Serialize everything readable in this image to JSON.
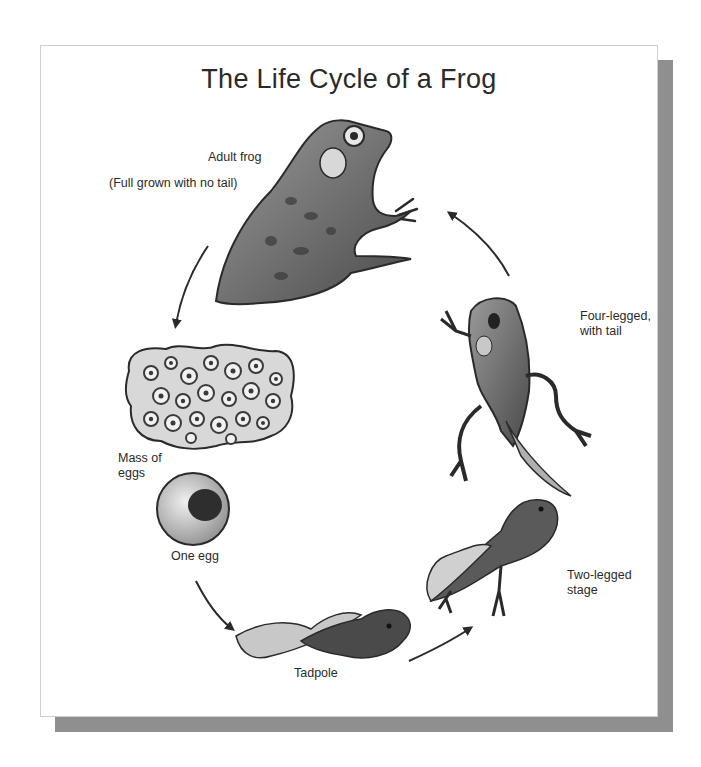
{
  "title": "The Life Cycle of a Frog",
  "stages": [
    {
      "id": "adult",
      "label": "Adult frog",
      "sublabel": "(Full grown with no tail)"
    },
    {
      "id": "egg-mass",
      "label": "Mass of\neggs"
    },
    {
      "id": "one-egg",
      "label": "One egg"
    },
    {
      "id": "tadpole",
      "label": "Tadpole"
    },
    {
      "id": "two-legged",
      "label": "Two-legged\nstage"
    },
    {
      "id": "four-legged",
      "label": "Four-legged,\nwith tail"
    }
  ],
  "cycle_order": [
    "Adult frog",
    "Mass of eggs",
    "One egg",
    "Tadpole",
    "Two-legged stage",
    "Four-legged, with tail",
    "Adult frog"
  ],
  "colors": {
    "card_shadow": "#8f8f8f",
    "ink": "#2a2a2a",
    "egg_mass_fill": "#d8d8d8"
  }
}
